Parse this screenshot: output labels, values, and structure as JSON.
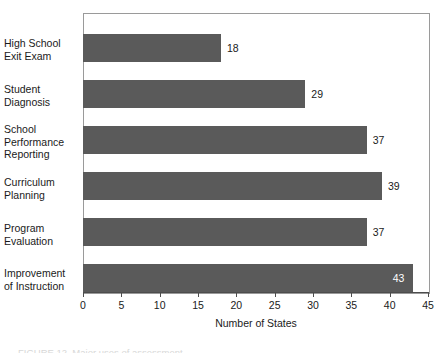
{
  "chart_data": {
    "type": "bar",
    "orientation": "horizontal",
    "title": "",
    "subtitle": "",
    "xlabel": "Number of States",
    "ylabel": "",
    "categories": [
      "High School\nExit Exam",
      "Student\nDiagnosis",
      "School\nPerformance\nReporting",
      "Curriculum\nPlanning",
      "Program\nEvaluation",
      "Improvement\nof Instruction"
    ],
    "values": [
      18,
      29,
      37,
      39,
      37,
      43
    ],
    "data_labels": [
      "18",
      "29",
      "37",
      "39",
      "37",
      "43"
    ],
    "data_label_placement": [
      "outside",
      "outside",
      "outside",
      "outside",
      "outside",
      "inside"
    ],
    "xlim": [
      0,
      45
    ],
    "xticks": [
      0,
      5,
      10,
      15,
      20,
      25,
      30,
      35,
      40,
      45
    ],
    "xtick_labels": [
      "0",
      "5",
      "10",
      "15",
      "20",
      "25",
      "30",
      "35",
      "40",
      "45"
    ],
    "grid": false,
    "legend": null,
    "colors": {
      "bar_fill": "#5a5a5a",
      "frame": "#9a9a9a",
      "axis": "#4d4d4d",
      "text": "#1a1a1a",
      "inside_label_text": "#ffffff",
      "background": "#ffffff"
    }
  },
  "caption": {
    "text": "FIGURE 12. Major uses of assessment"
  }
}
